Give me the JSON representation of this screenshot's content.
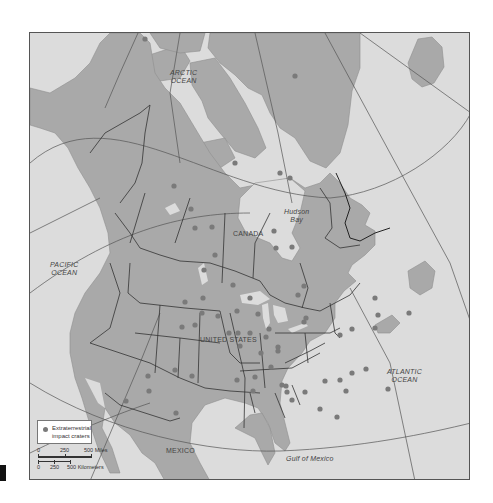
{
  "map": {
    "title": "Extraterrestrial impact craters of North America",
    "labels": {
      "arctic_ocean": "ARCTIC\nOCEAN",
      "arctic_ocean_line1": "ARCTIC",
      "arctic_ocean_line2": "OCEAN",
      "pacific_ocean_line1": "PACIFIC",
      "pacific_ocean_line2": "OCEAN",
      "atlantic_ocean_line1": "ATLANTIC",
      "atlantic_ocean_line2": "OCEAN",
      "hudson_bay_line1": "Hudson",
      "hudson_bay_line2": "Bay",
      "canada": "CANADA",
      "united_states": "UNITED STATES",
      "mexico": "MEXICO",
      "gulf_of_mexico": "Gulf of Mexico"
    },
    "legend": {
      "symbol": "gray-circle",
      "line1": "Extraterrestrial",
      "line2": "impact craters"
    },
    "scale": {
      "miles": {
        "labels": [
          "0",
          "250",
          "500 Miles"
        ]
      },
      "kilometers": {
        "labels": [
          "0",
          "250",
          "500 Kilometers"
        ]
      }
    },
    "north_arrow": {
      "label": "N"
    },
    "colors": {
      "water": "#dcdcdc",
      "land": "#a9a9a9",
      "crater": "#7a7a7a",
      "border": "#333333",
      "graticule": "#555555"
    },
    "craters": [
      [
        115,
        6
      ],
      [
        265,
        43
      ],
      [
        205,
        130
      ],
      [
        144,
        153
      ],
      [
        161,
        176
      ],
      [
        165,
        195
      ],
      [
        182,
        194
      ],
      [
        250,
        140
      ],
      [
        260,
        145
      ],
      [
        246,
        215
      ],
      [
        262,
        214
      ],
      [
        244,
        198
      ],
      [
        268,
        262
      ],
      [
        274,
        253
      ],
      [
        185,
        222
      ],
      [
        174,
        237
      ],
      [
        173,
        265
      ],
      [
        155,
        269
      ],
      [
        172,
        280
      ],
      [
        203,
        252
      ],
      [
        220,
        265
      ],
      [
        207,
        278
      ],
      [
        208,
        300
      ],
      [
        210,
        313
      ],
      [
        152,
        294
      ],
      [
        165,
        292
      ],
      [
        228,
        281
      ],
      [
        220,
        300
      ],
      [
        236,
        304
      ],
      [
        239,
        296
      ],
      [
        231,
        320
      ],
      [
        248,
        314
      ],
      [
        248,
        318
      ],
      [
        225,
        344
      ],
      [
        207,
        347
      ],
      [
        223,
        358
      ],
      [
        241,
        334
      ],
      [
        252,
        352
      ],
      [
        256,
        353
      ],
      [
        274,
        289
      ],
      [
        276,
        285
      ],
      [
        257,
        359
      ],
      [
        262,
        367
      ],
      [
        290,
        376
      ],
      [
        275,
        359
      ],
      [
        295,
        348
      ],
      [
        310,
        347
      ],
      [
        322,
        340
      ],
      [
        316,
        358
      ],
      [
        307,
        384
      ],
      [
        336,
        336
      ],
      [
        358,
        356
      ],
      [
        379,
        280
      ],
      [
        345,
        265
      ],
      [
        348,
        282
      ],
      [
        322,
        296
      ],
      [
        310,
        302
      ],
      [
        145,
        337
      ],
      [
        118,
        343
      ],
      [
        96,
        368
      ],
      [
        119,
        358
      ],
      [
        146,
        380
      ],
      [
        162,
        343
      ],
      [
        188,
        283
      ],
      [
        199,
        300
      ],
      [
        345,
        295
      ]
    ]
  }
}
